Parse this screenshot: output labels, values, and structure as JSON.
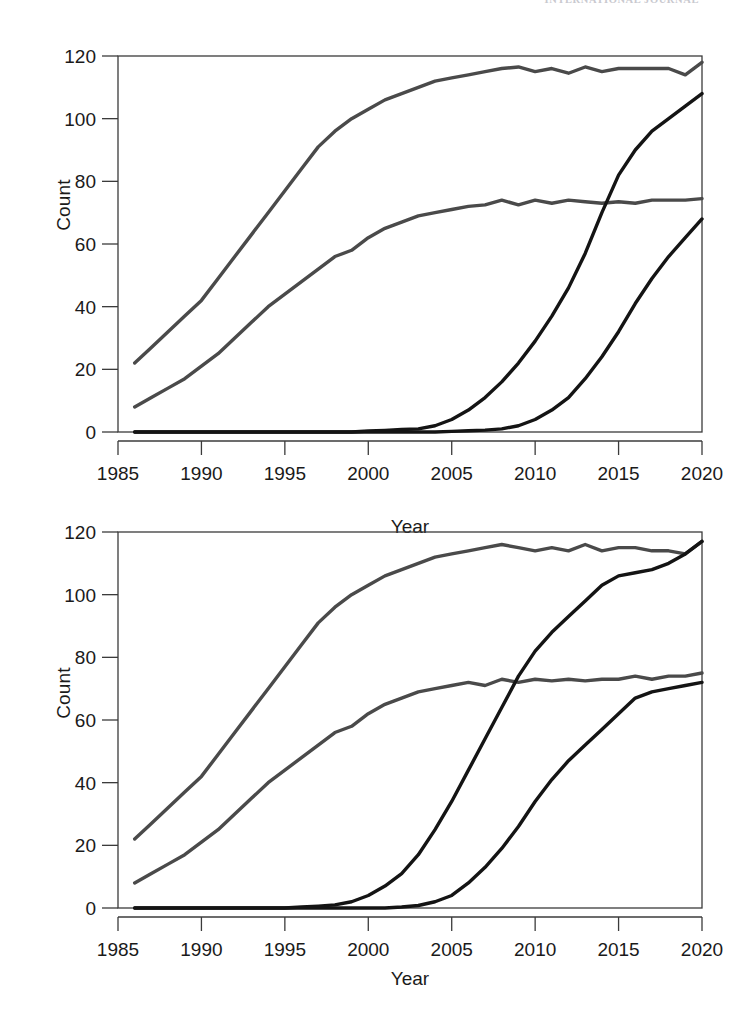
{
  "page": {
    "running_header": "INTERNATIONAL JOURNAL",
    "background_color": "#ffffff"
  },
  "panels": [
    {
      "id": "top",
      "x_axis_label": "Year",
      "y_axis_label": "Count",
      "x_ticks": [
        "1985",
        "1990",
        "1995",
        "2000",
        "2005",
        "2010",
        "2015",
        "2020"
      ],
      "y_ticks": [
        "0",
        "20",
        "40",
        "60",
        "80",
        "100",
        "120"
      ]
    },
    {
      "id": "bottom",
      "x_axis_label": "Year",
      "y_axis_label": "Count",
      "x_ticks": [
        "1985",
        "1990",
        "1995",
        "2000",
        "2005",
        "2010",
        "2015",
        "2020"
      ],
      "y_ticks": [
        "0",
        "20",
        "40",
        "60",
        "80",
        "100",
        "120"
      ]
    }
  ],
  "chart_data": [
    {
      "type": "line",
      "panel": "top",
      "title": "",
      "xlabel": "Year",
      "ylabel": "Count",
      "xlim": [
        1985,
        2020
      ],
      "ylim": [
        0,
        120
      ],
      "xticks": [
        1985,
        1990,
        1995,
        2000,
        2005,
        2010,
        2015,
        2020
      ],
      "yticks": [
        0,
        20,
        40,
        60,
        80,
        100,
        120
      ],
      "grid": false,
      "legend": "none",
      "x": [
        1986,
        1987,
        1988,
        1989,
        1990,
        1991,
        1992,
        1993,
        1994,
        1995,
        1996,
        1997,
        1998,
        1999,
        2000,
        2001,
        2002,
        2003,
        2004,
        2005,
        2006,
        2007,
        2008,
        2009,
        2010,
        2011,
        2012,
        2013,
        2014,
        2015,
        2016,
        2017,
        2018,
        2019,
        2020
      ],
      "series": [
        {
          "name": "upper-gray",
          "color": "#4a4a4a",
          "values": [
            22,
            27,
            32,
            37,
            42,
            49,
            56,
            63,
            70,
            77,
            84,
            91,
            96,
            100,
            103,
            106,
            108,
            110,
            112,
            113,
            114,
            115,
            116,
            116.5,
            115,
            116,
            114.5,
            116.5,
            115,
            116,
            116,
            116,
            116,
            114,
            118
          ]
        },
        {
          "name": "lower-gray",
          "color": "#4a4a4a",
          "values": [
            8,
            11,
            14,
            17,
            21,
            25,
            30,
            35,
            40,
            44,
            48,
            52,
            56,
            58,
            62,
            65,
            67,
            69,
            70,
            71,
            72,
            72.5,
            74,
            72.5,
            74,
            73,
            74,
            73.5,
            73,
            73.5,
            73,
            74,
            74,
            74,
            74.5
          ]
        },
        {
          "name": "upper-black",
          "color": "#141414",
          "values": [
            0,
            0,
            0,
            0,
            0,
            0,
            0,
            0,
            0,
            0,
            0,
            0,
            0,
            0,
            0.3,
            0.5,
            0.8,
            1,
            2,
            4,
            7,
            11,
            16,
            22,
            29,
            37,
            46,
            57,
            70,
            82,
            90,
            96,
            100,
            104,
            108
          ]
        },
        {
          "name": "lower-black",
          "color": "#141414",
          "values": [
            0,
            0,
            0,
            0,
            0,
            0,
            0,
            0,
            0,
            0,
            0,
            0,
            0,
            0,
            0,
            0,
            0,
            0,
            0,
            0.2,
            0.4,
            0.6,
            1,
            2,
            4,
            7,
            11,
            17,
            24,
            32,
            41,
            49,
            56,
            62,
            68
          ]
        }
      ]
    },
    {
      "type": "line",
      "panel": "bottom",
      "title": "",
      "xlabel": "Year",
      "ylabel": "Count",
      "xlim": [
        1985,
        2020
      ],
      "ylim": [
        0,
        120
      ],
      "xticks": [
        1985,
        1990,
        1995,
        2000,
        2005,
        2010,
        2015,
        2020
      ],
      "yticks": [
        0,
        20,
        40,
        60,
        80,
        100,
        120
      ],
      "grid": false,
      "legend": "none",
      "x": [
        1986,
        1987,
        1988,
        1989,
        1990,
        1991,
        1992,
        1993,
        1994,
        1995,
        1996,
        1997,
        1998,
        1999,
        2000,
        2001,
        2002,
        2003,
        2004,
        2005,
        2006,
        2007,
        2008,
        2009,
        2010,
        2011,
        2012,
        2013,
        2014,
        2015,
        2016,
        2017,
        2018,
        2019,
        2020
      ],
      "series": [
        {
          "name": "upper-gray",
          "color": "#4a4a4a",
          "values": [
            22,
            27,
            32,
            37,
            42,
            49,
            56,
            63,
            70,
            77,
            84,
            91,
            96,
            100,
            103,
            106,
            108,
            110,
            112,
            113,
            114,
            115,
            116,
            115,
            114,
            115,
            114,
            116,
            114,
            115,
            115,
            114,
            114,
            113,
            117
          ]
        },
        {
          "name": "lower-gray",
          "color": "#4a4a4a",
          "values": [
            8,
            11,
            14,
            17,
            21,
            25,
            30,
            35,
            40,
            44,
            48,
            52,
            56,
            58,
            62,
            65,
            67,
            69,
            70,
            71,
            72,
            71,
            73,
            72,
            73,
            72.5,
            73,
            72.5,
            73,
            73,
            74,
            73,
            74,
            74,
            75
          ]
        },
        {
          "name": "upper-black",
          "color": "#141414",
          "values": [
            0,
            0,
            0,
            0,
            0,
            0,
            0,
            0,
            0,
            0,
            0.3,
            0.6,
            1,
            2,
            4,
            7,
            11,
            17,
            25,
            34,
            44,
            54,
            64,
            74,
            82,
            88,
            93,
            98,
            103,
            106,
            107,
            108,
            110,
            113,
            117
          ]
        },
        {
          "name": "lower-black",
          "color": "#141414",
          "values": [
            0,
            0,
            0,
            0,
            0,
            0,
            0,
            0,
            0,
            0,
            0,
            0,
            0,
            0,
            0,
            0,
            0.3,
            0.8,
            2,
            4,
            8,
            13,
            19,
            26,
            34,
            41,
            47,
            52,
            57,
            62,
            67,
            69,
            70,
            71,
            72
          ]
        }
      ]
    }
  ]
}
